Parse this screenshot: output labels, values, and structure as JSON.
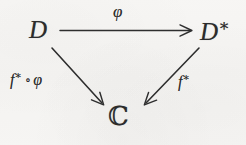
{
  "figure": {
    "kind": "commutative-diagram",
    "shape": "triangle",
    "background_color": "#f6f5f3",
    "ink_color": "#2b2b2b"
  },
  "nodes": {
    "source": {
      "id": "D",
      "text": "D"
    },
    "target": {
      "id": "D*",
      "base": "D",
      "superscript": "∗"
    },
    "base": {
      "id": "C",
      "text": "ℂ"
    }
  },
  "arrows": {
    "top": {
      "from": "D",
      "to": "D*",
      "direction": "right",
      "label": "φ",
      "label_position": "above"
    },
    "left": {
      "from": "D",
      "to": "ℂ",
      "direction": "down-right",
      "label_base": "f",
      "label_superscript": "∗",
      "label_operator": "∘",
      "label_argument": "φ",
      "label_position": "left"
    },
    "right": {
      "from": "D*",
      "to": "ℂ",
      "direction": "down-left",
      "label_base": "f",
      "label_superscript": "∗",
      "label_position": "right"
    }
  }
}
